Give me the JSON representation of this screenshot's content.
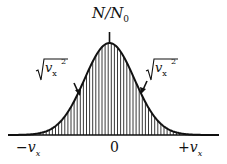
{
  "diagram": {
    "title_main": "N/N",
    "title_sub": "0",
    "annotation_left": {
      "radicand": "v",
      "subscript": "x",
      "superscript": "2"
    },
    "annotation_right": {
      "radicand": "v",
      "subscript": "x",
      "superscript": "2"
    },
    "x_labels": {
      "left": {
        "sign": "−",
        "var": "v",
        "sub": "x"
      },
      "center": "0",
      "right": {
        "sign": "+",
        "var": "v",
        "sub": "x"
      }
    },
    "curve": "gaussian",
    "fill": "vertical hatching"
  }
}
